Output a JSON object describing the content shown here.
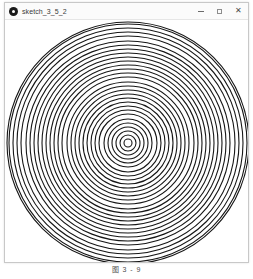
{
  "window": {
    "title": "sketch_3_5_2",
    "app_icon": "processing-circle-icon",
    "controls": {
      "minimize_label": "–",
      "maximize_label": "□",
      "close_label": "✕"
    }
  },
  "canvas": {
    "name": "concentric-circles-sketch",
    "background_color": "#ffffff",
    "stroke_color": "#1a1a1a"
  },
  "caption": {
    "text": "图 3 - 9"
  },
  "chart_data": {
    "type": "scatter",
    "title": "",
    "xlabel": "",
    "ylabel": "",
    "center": {
      "x": 128,
      "y": 143
    },
    "ring_count": 30,
    "ring_spacing": 4.05,
    "outer_radius": 121,
    "inner_radius": 4,
    "stroke_width": 1.1,
    "stroke_color": "#161616",
    "fill": "none",
    "radii": [
      4,
      8,
      12,
      16,
      20,
      24,
      29,
      33,
      37,
      41,
      45,
      49,
      53,
      57,
      61,
      66,
      70,
      74,
      78,
      82,
      86,
      90,
      94,
      98,
      102,
      107,
      111,
      115,
      119,
      121
    ],
    "grid": false,
    "legend": "none"
  }
}
